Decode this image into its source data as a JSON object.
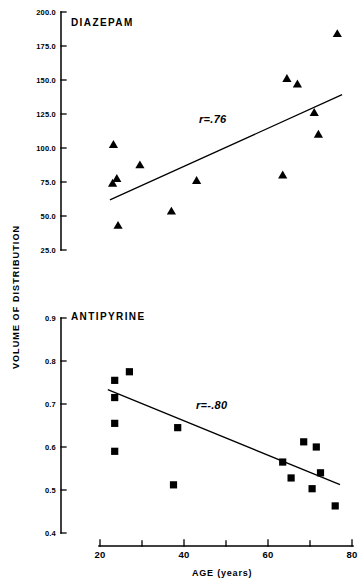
{
  "figure": {
    "y_axis_title": "VOLUME OF DISTRIBUTION",
    "x_axis_title": "AGE (years)"
  },
  "chart_data": [
    {
      "type": "scatter",
      "title": "DIAZEPAM",
      "xlabel": "AGE (years)",
      "ylabel": "VOLUME OF DISTRIBUTION",
      "xlim": [
        20,
        80
      ],
      "ylim": [
        25.0,
        200.0
      ],
      "xticks": [
        20,
        30,
        40,
        50,
        60,
        70,
        80
      ],
      "xticklabels": [
        "20",
        "",
        "40",
        "",
        "60",
        "",
        "80"
      ],
      "yticks": [
        25.0,
        50.0,
        75.0,
        100.0,
        125.0,
        150.0,
        175.0,
        200.0
      ],
      "yticklabels": [
        "25.0",
        "50.0",
        "75.0",
        "100.0",
        "125.0",
        "150.0",
        "175.0",
        "200.0"
      ],
      "grid": false,
      "marker": "triangle",
      "annotation": "r=.76",
      "annotation_xy": [
        47.5,
        114
      ],
      "points": [
        {
          "x": 23.2,
          "y": 102.5
        },
        {
          "x": 23.0,
          "y": 74.0
        },
        {
          "x": 24.0,
          "y": 77.5
        },
        {
          "x": 24.3,
          "y": 43.0
        },
        {
          "x": 29.5,
          "y": 87.5
        },
        {
          "x": 37.0,
          "y": 53.5
        },
        {
          "x": 43.0,
          "y": 76.0
        },
        {
          "x": 63.5,
          "y": 80.0
        },
        {
          "x": 64.5,
          "y": 151.0
        },
        {
          "x": 67.0,
          "y": 147.0
        },
        {
          "x": 71.0,
          "y": 126.0
        },
        {
          "x": 72.0,
          "y": 110.0
        },
        {
          "x": 76.5,
          "y": 184.0
        }
      ],
      "fit_line": {
        "x1": 22.5,
        "y1": 62.0,
        "x2": 77.5,
        "y2": 139.0
      }
    },
    {
      "type": "scatter",
      "title": "ANTIPYRINE",
      "xlabel": "AGE (years)",
      "ylabel": "VOLUME OF DISTRIBUTION",
      "xlim": [
        20,
        80
      ],
      "ylim": [
        0.4,
        0.9
      ],
      "xticks": [
        20,
        30,
        40,
        50,
        60,
        70,
        80
      ],
      "xticklabels": [
        "20",
        "",
        "40",
        "",
        "60",
        "",
        "80"
      ],
      "yticks": [
        0.4,
        0.5,
        0.6,
        0.7,
        0.8,
        0.9
      ],
      "yticklabels": [
        "0.4",
        "0.5",
        "0.6",
        "0.7",
        "0.8",
        "0.9"
      ],
      "grid": false,
      "marker": "square",
      "annotation": "r=-.80",
      "annotation_xy": [
        48.0,
        0.645
      ],
      "points": [
        {
          "x": 23.5,
          "y": 0.755
        },
        {
          "x": 23.5,
          "y": 0.715
        },
        {
          "x": 23.5,
          "y": 0.655
        },
        {
          "x": 23.5,
          "y": 0.59
        },
        {
          "x": 27.0,
          "y": 0.775
        },
        {
          "x": 37.5,
          "y": 0.512
        },
        {
          "x": 38.5,
          "y": 0.645
        },
        {
          "x": 63.5,
          "y": 0.565
        },
        {
          "x": 65.5,
          "y": 0.528
        },
        {
          "x": 68.5,
          "y": 0.612
        },
        {
          "x": 70.5,
          "y": 0.503
        },
        {
          "x": 71.5,
          "y": 0.6
        },
        {
          "x": 72.5,
          "y": 0.54
        },
        {
          "x": 76.0,
          "y": 0.463
        }
      ],
      "fit_line": {
        "x1": 22.0,
        "y1": 0.733,
        "x2": 77.0,
        "y2": 0.513
      }
    }
  ]
}
